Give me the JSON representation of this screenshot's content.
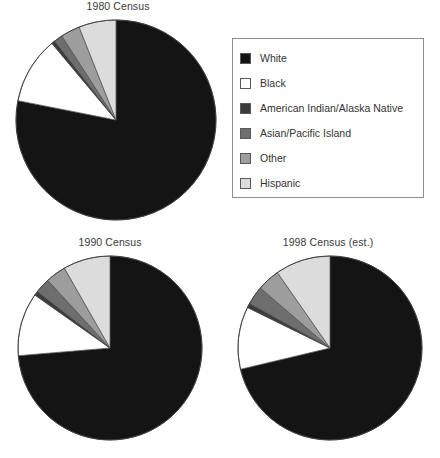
{
  "legend": {
    "name": "Race / Hispanic origin legend",
    "items": [
      {
        "label": "White",
        "color": "#141414"
      },
      {
        "label": "Black",
        "color": "#ffffff"
      },
      {
        "label": "American Indian/Alaska Native",
        "color": "#3b3b3b"
      },
      {
        "label": "Asian/Pacific Island",
        "color": "#6e6e6e"
      },
      {
        "label": "Other",
        "color": "#9d9d9d"
      },
      {
        "label": "Hispanic",
        "color": "#dcdcdc"
      }
    ]
  },
  "charts": [
    {
      "id": "census-1980",
      "title": "1980 Census",
      "cx": 112,
      "cy": 104,
      "r": 100,
      "width": 228,
      "height": 210
    },
    {
      "id": "census-1990",
      "title": "1990 Census",
      "cx": 110,
      "cy": 96,
      "r": 92,
      "width": 220,
      "height": 200
    },
    {
      "id": "census-1998",
      "title": "1998 Census (est.)",
      "cx": 114,
      "cy": 96,
      "r": 92,
      "width": 224,
      "height": 200
    }
  ],
  "chart_data": [
    {
      "type": "pie",
      "title": "1980 Census",
      "start_angle_deg": 0,
      "direction": "clockwise",
      "categories": [
        "White",
        "Black",
        "American Indian/Alaska Native",
        "Asian/Pacific Island",
        "Other",
        "Hispanic"
      ],
      "values": [
        83.1,
        11.5,
        0.6,
        1.5,
        3.3,
        6.4
      ],
      "unit": "percent",
      "colors": [
        "#141414",
        "#ffffff",
        "#3b3b3b",
        "#6e6e6e",
        "#9d9d9d",
        "#dcdcdc"
      ],
      "xlabel": "",
      "ylabel": "",
      "legend_position": "top-right",
      "grid": false
    },
    {
      "type": "pie",
      "title": "1990 Census",
      "start_angle_deg": 0,
      "direction": "clockwise",
      "categories": [
        "White",
        "Black",
        "American Indian/Alaska Native",
        "Asian/Pacific Island",
        "Other",
        "Hispanic"
      ],
      "values": [
        80.3,
        12.1,
        0.8,
        2.9,
        3.9,
        9.0
      ],
      "unit": "percent",
      "colors": [
        "#141414",
        "#ffffff",
        "#3b3b3b",
        "#6e6e6e",
        "#9d9d9d",
        "#dcdcdc"
      ],
      "xlabel": "",
      "ylabel": "",
      "legend_position": "top-right",
      "grid": false
    },
    {
      "type": "pie",
      "title": "1998 Census (est.)",
      "start_angle_deg": 0,
      "direction": "clockwise",
      "categories": [
        "White",
        "Black",
        "American Indian/Alaska Native",
        "Asian/Pacific Island",
        "Other",
        "Hispanic"
      ],
      "values": [
        82.4,
        12.7,
        0.9,
        3.8,
        4.6,
        11.2
      ],
      "unit": "percent",
      "colors": [
        "#141414",
        "#ffffff",
        "#3b3b3b",
        "#6e6e6e",
        "#9d9d9d",
        "#dcdcdc"
      ],
      "xlabel": "",
      "ylabel": "",
      "legend_position": "top-right",
      "grid": false
    }
  ]
}
